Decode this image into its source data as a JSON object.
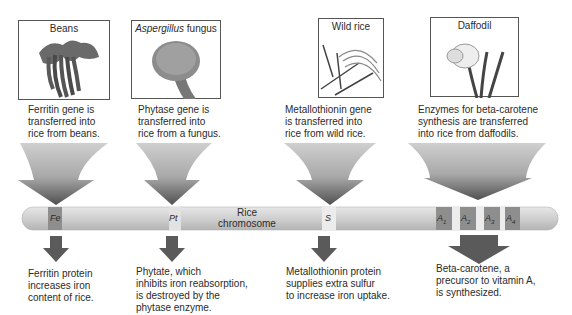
{
  "sources": [
    {
      "id": "beans",
      "title": "Beans",
      "gene_text": "Ferritin gene is\ntransferred into\nrice from beans."
    },
    {
      "id": "fungus",
      "title_italic": "Aspergillus",
      "title_rest": " fungus",
      "gene_text": "Phytase gene is\ntransferred into\nrice from a fungus."
    },
    {
      "id": "wildrice",
      "title": "Wild rice",
      "gene_text": "Metallothionin gene\nis transferred into\nrice from wild rice."
    },
    {
      "id": "daffodil",
      "title": "Daffodil",
      "gene_text": "Enzymes for beta-carotene\nsynthesis are transferred\ninto rice from daffodils."
    }
  ],
  "chromosome": {
    "label": "Rice\nchromosome",
    "genes": [
      "Fe",
      "Pt",
      "S",
      "A1",
      "A2",
      "A3",
      "A4"
    ]
  },
  "results": [
    "Ferritin protein\nincreases iron\ncontent of rice.",
    "Phytate, which\ninhibits iron reabsorption,\nis destroyed by the\nphytase enzyme.",
    "Metallothionin protein\nsupplies extra sulfur\nto increase iron uptake.",
    "Beta-carotene, a\nprecursor to vitamin A,\nis synthesized."
  ],
  "colors": {
    "arrow_top": "#c8c8c8",
    "arrow_bottom": "#555555",
    "chromosome": "#d6d6d6",
    "gene_band_dark": "#8a8a8a",
    "gene_band_light": "#ececec"
  }
}
